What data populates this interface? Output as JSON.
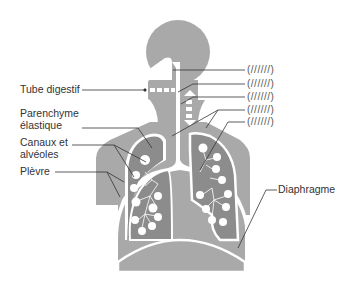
{
  "diagram": {
    "title": "",
    "colors": {
      "body": "#a9a9a9",
      "lung": "#8c8c8c",
      "outline": "#ffffff",
      "leader": "#333333",
      "background": "#ffffff"
    },
    "left_labels": [
      {
        "id": "tube-digestif",
        "text": "Tube digestif"
      },
      {
        "id": "parenchyme",
        "line1": "Parenchyme",
        "line2": "élastique"
      },
      {
        "id": "canaux",
        "line1": "Canaux et",
        "line2": "alvéoles"
      },
      {
        "id": "plevre",
        "text": "Plèvre"
      }
    ],
    "right_labels": [
      {
        "id": "diaphragme",
        "text": "Diaphragme"
      }
    ],
    "hatched_labels": [
      "(//////)",
      "(//////)",
      "(//////)",
      "(//////)",
      "(//////)"
    ]
  }
}
